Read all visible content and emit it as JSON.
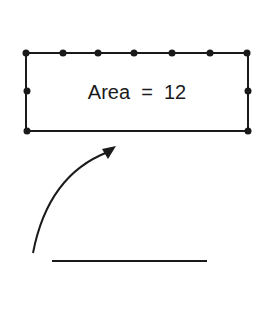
{
  "diagram": {
    "rectangle": {
      "label": "Area  =  12",
      "stroke": "#1a1a1a",
      "top_dots": 7,
      "side_dots": 3
    },
    "arrow": {
      "direction": "curved-up-right"
    },
    "segment": {
      "description": "horizontal line segment"
    }
  }
}
